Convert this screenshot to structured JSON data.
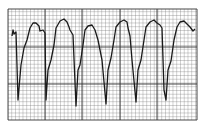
{
  "figure": {
    "beats_visible": 6,
    "colors": {
      "background": "#ffffff",
      "grid": "#555555",
      "trace": "#222222"
    }
  }
}
